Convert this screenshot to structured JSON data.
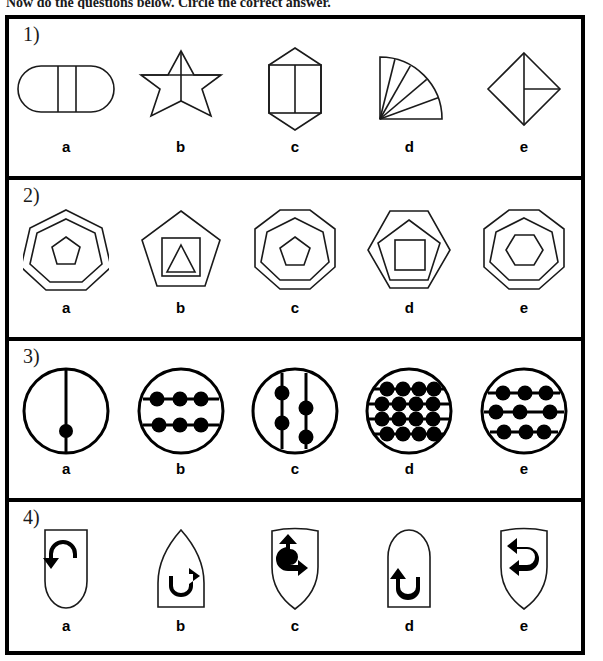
{
  "instruction": "Now do the questions below. Circle the correct answer.",
  "page": {
    "width": 603,
    "height": 661,
    "ink_color": "#000000",
    "background_color": "#ffffff"
  },
  "option_labels": [
    "a",
    "b",
    "c",
    "d",
    "e"
  ],
  "questions": [
    {
      "number": "1)",
      "options": [
        {
          "label": "a",
          "shape": "stadium-divided-into-three-parts",
          "description": "Horizontal stadium (rounded rectangle) divided by two vertical lines into three sections"
        },
        {
          "label": "b",
          "shape": "six-pointed-star-with-cross",
          "description": "Six pointed star containing a horizontal and a vertical line crossing at the centre"
        },
        {
          "label": "c",
          "shape": "hexagonal-crystal-with-divided-rectangle",
          "description": "Elongated hexagon (crystal) with an inner rectangle split by a vertical line"
        },
        {
          "label": "d",
          "shape": "quarter-circle-five-sectors",
          "description": "Quarter circle fan divided into five sectors"
        },
        {
          "label": "e",
          "shape": "diamond-with-vertical-and-half-horizontal-line",
          "description": "Square rotated 45 degrees with a full vertical line and a horizontal line on the right half"
        }
      ]
    },
    {
      "number": "2)",
      "options": [
        {
          "label": "a",
          "shape": "heptagon-heptagon-pentagon",
          "description": "Heptagon containing a heptagon containing a small pentagon"
        },
        {
          "label": "b",
          "shape": "pentagon-square-triangle",
          "description": "Pentagon containing a square containing a triangle"
        },
        {
          "label": "c",
          "shape": "octagon-heptagon-pentagon",
          "description": "Octagon containing a heptagon containing a pentagon"
        },
        {
          "label": "d",
          "shape": "hexagon-pentagon-square",
          "description": "Hexagon containing a pentagon containing a square"
        },
        {
          "label": "e",
          "shape": "octagon-heptagon-hexagon",
          "description": "Octagon containing a heptagon containing a hexagon"
        }
      ]
    },
    {
      "number": "3)",
      "options": [
        {
          "label": "a",
          "shape": "circle-one-vertical-line-one-dot",
          "lines": 1,
          "line_orientation": "vertical",
          "dots": 1,
          "description": "Circle with one vertical line carrying a single dot"
        },
        {
          "label": "b",
          "shape": "circle-two-horizontal-lines-six-dots",
          "lines": 2,
          "line_orientation": "horizontal",
          "dots": 6,
          "description": "Circle with two horizontal lines, three dots on each"
        },
        {
          "label": "c",
          "shape": "circle-two-vertical-lines-four-dots",
          "lines": 2,
          "line_orientation": "vertical",
          "dots": 4,
          "description": "Circle with two vertical lines, two dots on each"
        },
        {
          "label": "d",
          "shape": "circle-four-horizontal-lines-sixteen-dots",
          "lines": 4,
          "line_orientation": "horizontal",
          "dots": 16,
          "description": "Circle with four horizontal lines, four dots on each"
        },
        {
          "label": "e",
          "shape": "circle-three-horizontal-lines-nine-dots",
          "lines": 3,
          "line_orientation": "horizontal",
          "dots": 9,
          "description": "Circle with three horizontal lines, three dots on each"
        }
      ]
    },
    {
      "number": "4)",
      "options": [
        {
          "label": "a",
          "shape": "round-bottom-tag-with-left-curved-arrow",
          "description": "Flat top, rounded bottom shape containing a curved arrow pointing down-left"
        },
        {
          "label": "b",
          "shape": "pointed-top-shape-with-up-right-curved-arrow",
          "description": "Pointed top, flat bottom shape containing a U-turn arrow pointing up-right"
        },
        {
          "label": "c",
          "shape": "shield-with-right-curved-arrow",
          "description": "Shield shape containing a curved arrow pointing right"
        },
        {
          "label": "d",
          "shape": "round-top-shape-with-up-left-curved-arrow",
          "description": "Rounded top, flat bottom shape containing a U-turn arrow pointing up-left"
        },
        {
          "label": "e",
          "shape": "shield-with-up-left-curved-arrow",
          "description": "Shield shape containing a curved arrow pointing up-left"
        }
      ]
    }
  ]
}
